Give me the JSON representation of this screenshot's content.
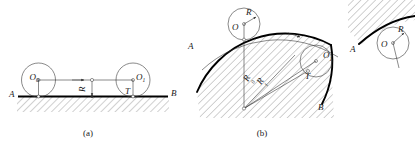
{
  "figure": {
    "panels": [
      {
        "id": "a",
        "caption": "(a)",
        "description": "circle rolling along a straight horizontal ground line",
        "labels": {
          "left_center": "O",
          "left_center_sub": "0",
          "right_center": "O",
          "right_center_sub": "1",
          "tangent_point": "T",
          "radius": "R",
          "line_start": "A",
          "line_end": "B"
        }
      },
      {
        "id": "b",
        "caption": "(b)",
        "description": "circle rolling along a convex circular arc",
        "labels": {
          "left_center": "O",
          "right_center": "O",
          "right_center_sub": "1",
          "tangent_point": "T",
          "radius_small": "R",
          "radius_base": "R",
          "radius_base_sub": "0",
          "radius_sum": "R",
          "radius_sum_sub": "1",
          "arc_start": "A",
          "arc_end": "B"
        }
      },
      {
        "id": "c",
        "caption": "",
        "description": "cropped third panel at right edge: concave arc with circle",
        "labels": {
          "center": "O",
          "radius": "R",
          "arc_start": "A"
        }
      }
    ],
    "colors": {
      "ink": "#1a1a1a",
      "line": "#2b2b2b",
      "ground": "#000000",
      "paper": "#ffffff"
    }
  }
}
